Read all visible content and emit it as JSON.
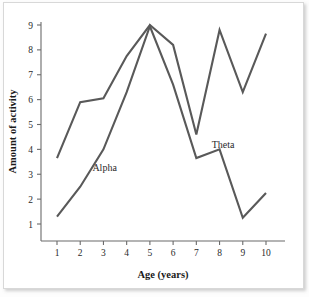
{
  "chart_data": {
    "type": "line",
    "title": "",
    "xlabel": "Age (years)",
    "ylabel": "Amount of activity",
    "x": [
      1,
      2,
      3,
      4,
      5,
      6,
      7,
      8,
      9,
      10
    ],
    "xticks": [
      "1",
      "2",
      "3",
      "4",
      "5",
      "6",
      "7",
      "8",
      "9",
      "10"
    ],
    "yticks": [
      "1",
      "2",
      "3",
      "4",
      "5",
      "6",
      "7",
      "8",
      "9"
    ],
    "xlim": [
      0.4,
      10.6
    ],
    "ylim": [
      0,
      9.6
    ],
    "grid": false,
    "legend_position": "inline-annotations",
    "series": [
      {
        "name": "Theta",
        "color": "#595959",
        "values": [
          3.65,
          5.9,
          6.05,
          7.75,
          9.0,
          8.2,
          4.6,
          8.8,
          6.3,
          8.65
        ],
        "label_x": 8.15,
        "label_y": 4.05
      },
      {
        "name": "Alpha",
        "color": "#595959",
        "values": [
          1.3,
          2.5,
          4.0,
          6.3,
          8.95,
          6.6,
          3.65,
          4.0,
          1.25,
          2.25
        ],
        "label_x": 3.05,
        "label_y": 3.15
      }
    ],
    "annotations": [
      {
        "text": "Alpha",
        "x": 3.05,
        "y": 3.15
      },
      {
        "text": "Theta",
        "x": 8.15,
        "y": 4.05
      }
    ]
  },
  "axes": {
    "x_title": "Age (years)",
    "y_title": "Amount of activity"
  }
}
